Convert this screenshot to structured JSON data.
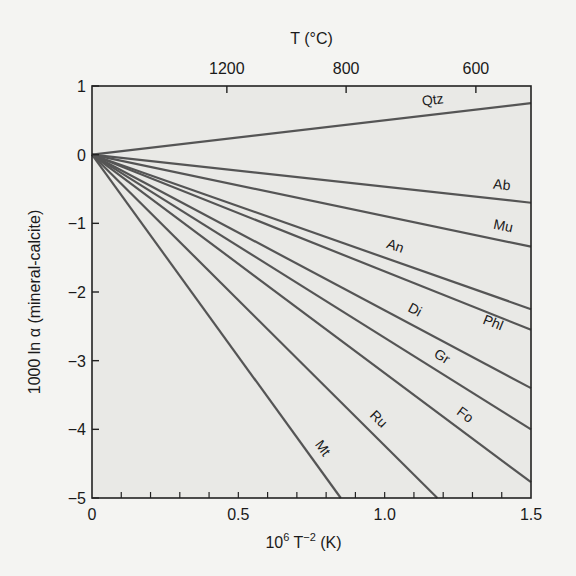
{
  "chart_data": {
    "type": "line",
    "title": "",
    "xlabel": "10^6 T^-2 (K)",
    "ylabel": "1000 ln α (mineral-calcite)",
    "top_axis_label": "T (°C)",
    "xlim": [
      0,
      1.5
    ],
    "ylim": [
      -5,
      1
    ],
    "x_ticks": [
      "0",
      "0.5",
      "1.0",
      "1.5"
    ],
    "y_ticks": [
      "1",
      "0",
      "−1",
      "−2",
      "−3",
      "−4",
      "−5"
    ],
    "top_ticks": [
      "1200",
      "800",
      "600"
    ],
    "grid": false,
    "legend": "inline labels",
    "series": [
      {
        "name": "Qtz",
        "x": [
          0,
          1.5
        ],
        "values": [
          0,
          0.75
        ]
      },
      {
        "name": "Ab",
        "x": [
          0,
          1.5
        ],
        "values": [
          0,
          -0.7
        ]
      },
      {
        "name": "Mu",
        "x": [
          0,
          1.5
        ],
        "values": [
          0,
          -1.34
        ]
      },
      {
        "name": "An",
        "x": [
          0,
          1.5
        ],
        "values": [
          0,
          -2.25
        ]
      },
      {
        "name": "Phl",
        "x": [
          0,
          1.5
        ],
        "values": [
          0,
          -2.55
        ]
      },
      {
        "name": "Di",
        "x": [
          0,
          1.5
        ],
        "values": [
          0,
          -3.4
        ]
      },
      {
        "name": "Gr",
        "x": [
          0,
          1.5
        ],
        "values": [
          0,
          -4.0
        ]
      },
      {
        "name": "Fo",
        "x": [
          0,
          1.5
        ],
        "values": [
          0,
          -4.77
        ]
      },
      {
        "name": "Ru",
        "x": [
          0,
          1.18
        ],
        "values": [
          0,
          -5.0
        ]
      },
      {
        "name": "Mt",
        "x": [
          0,
          0.85
        ],
        "values": [
          0,
          -5.0
        ]
      }
    ]
  }
}
